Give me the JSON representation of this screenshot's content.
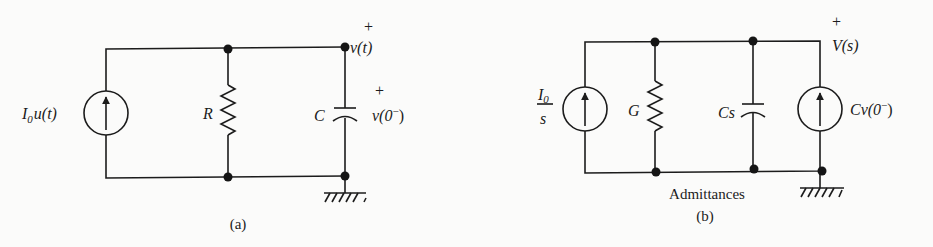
{
  "figure": {
    "panels": [
      {
        "id": "a",
        "caption": "(a)",
        "source": {
          "symbol": "I",
          "subscript": "0",
          "rest": "u(t)",
          "type": "current-source-arrow-up"
        },
        "resistor": {
          "label": "R"
        },
        "capacitor": {
          "label": "C"
        },
        "initial_voltage": {
          "plus": "+",
          "label_main": "v(0",
          "label_sup": "−",
          "label_close": ")"
        },
        "output_voltage": {
          "plus": "+",
          "label": "v(t)"
        },
        "ground": "ground-symbol"
      },
      {
        "id": "b",
        "caption": "(b)",
        "subtitle": "Admittances",
        "source": {
          "numerator": "I",
          "numerator_sub": "0",
          "denominator": "s",
          "type": "current-source-arrow-up"
        },
        "conductance": {
          "label": "G"
        },
        "capacitance": {
          "label": "Cs"
        },
        "ic_source": {
          "label_main": "Cv(0",
          "label_sup": "−",
          "label_close": ")",
          "type": "current-source-arrow-up"
        },
        "output_voltage": {
          "plus": "+",
          "label": "V(s)"
        },
        "ground": "ground-symbol"
      }
    ]
  }
}
